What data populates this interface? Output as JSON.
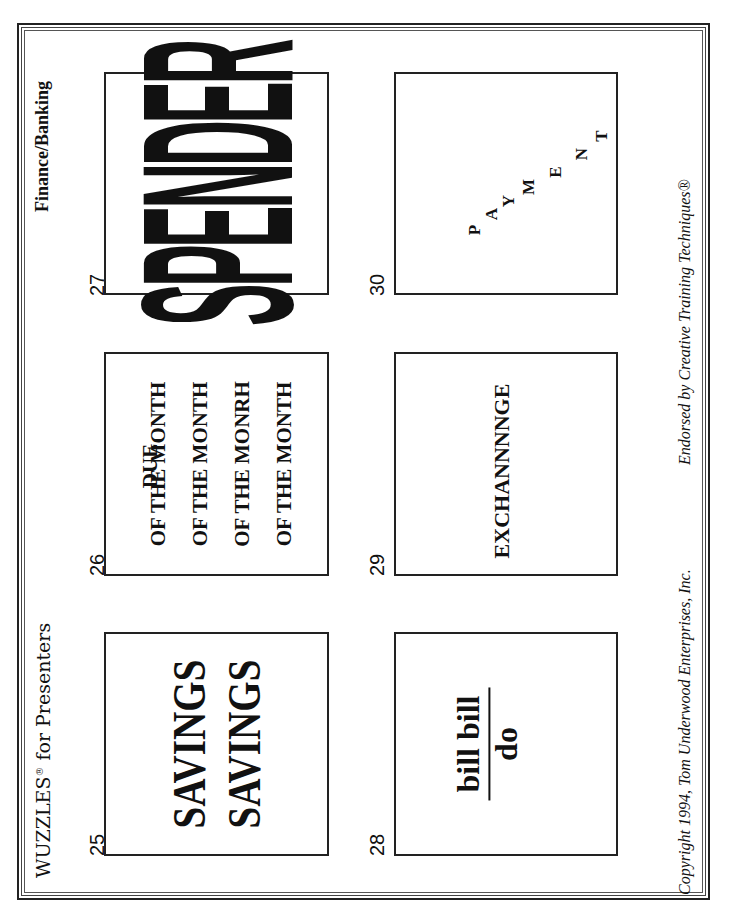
{
  "page": {
    "header_left": "WUZZLES",
    "header_left_mark": "®",
    "header_left_suffix": " for Presenters",
    "header_right": "Finance/Banking",
    "footer_left": "Copyright 1994, Tom Underwood Enterprises, Inc.",
    "footer_right": "Endorsed by Creative Training Techniques®"
  },
  "puzzles": [
    {
      "number": "25",
      "lines": [
        "SAVINGS",
        "SAVINGS"
      ]
    },
    {
      "number": "26",
      "top_word": "DUE",
      "lines": [
        "OF THE MONTH",
        "OF THE MONTH",
        "OF THE MONRH",
        "OF THE MONTH"
      ]
    },
    {
      "number": "27",
      "text": "SPENDER"
    },
    {
      "number": "28",
      "numerator": "bill bill",
      "denominator": "do"
    },
    {
      "number": "29",
      "text": "EXCHANNNNGE"
    },
    {
      "number": "30",
      "letters": [
        "P",
        "A",
        "Y",
        "M",
        "E",
        "N",
        "T"
      ]
    }
  ]
}
